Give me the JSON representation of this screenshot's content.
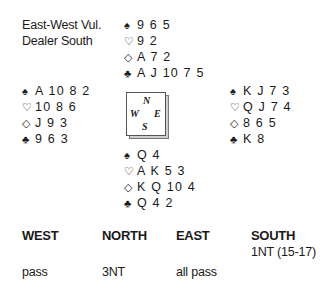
{
  "info": {
    "vulnerability": "East-West Vul.",
    "dealer": "Dealer South"
  },
  "suit_symbols": {
    "spades": "♠",
    "hearts": "♡",
    "diamonds": "◇",
    "clubs": "♣"
  },
  "hands": {
    "north": {
      "spades": "9 6 5",
      "hearts": "9 2",
      "diamonds": "A 7 2",
      "clubs": "A J 10 7 5"
    },
    "west": {
      "spades": "A 10 8 2",
      "hearts": "10 8 6",
      "diamonds": "J 9 3",
      "clubs": "9 6 3"
    },
    "east": {
      "spades": "K J 7 3",
      "hearts": "Q J 7 4",
      "diamonds": "8 6 5",
      "clubs": "K 8"
    },
    "south": {
      "spades": "Q 4",
      "hearts": "A K 5 3",
      "diamonds": "K Q 10 4",
      "clubs": "Q 4 2"
    }
  },
  "compass": {
    "n": "N",
    "e": "E",
    "s": "S",
    "w": "W"
  },
  "auction": {
    "headers": [
      "WEST",
      "NORTH",
      "EAST",
      "SOUTH"
    ],
    "rows": [
      [
        "",
        "",
        "",
        "1NT (15-17)"
      ],
      [
        "pass",
        "3NT",
        "all pass",
        ""
      ]
    ]
  }
}
